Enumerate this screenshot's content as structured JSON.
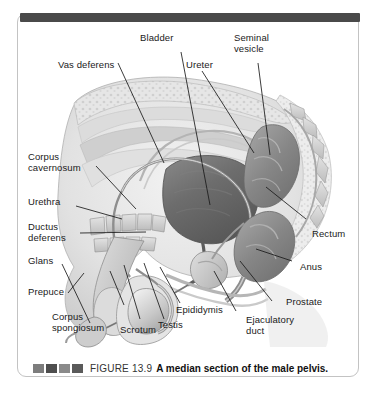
{
  "figure": {
    "number_label": "FIGURE 13.9",
    "caption": "A median section of the male pelvis.",
    "decor_blocks": [
      "block-1",
      "block-2",
      "block-3",
      "block-4"
    ],
    "frame_color": "#c3c3c3",
    "top_rule_color": "#4a4a4a"
  },
  "labels": [
    {
      "id": "bladder",
      "text": "Bladder"
    },
    {
      "id": "seminal-vesicle",
      "text": "Seminal\nvesicle"
    },
    {
      "id": "ureter",
      "text": "Ureter"
    },
    {
      "id": "vas-deferens",
      "text": "Vas deferens"
    },
    {
      "id": "corpus-cavernosum",
      "text": "Corpus\ncavernosum"
    },
    {
      "id": "urethra",
      "text": "Urethra"
    },
    {
      "id": "ductus-deferens",
      "text": "Ductus\ndeferens"
    },
    {
      "id": "glans",
      "text": "Glans"
    },
    {
      "id": "prepuce",
      "text": "Prepuce"
    },
    {
      "id": "corpus-spongiosum",
      "text": "Corpus\nspongiosum"
    },
    {
      "id": "scrotum",
      "text": "Scrotum"
    },
    {
      "id": "testis",
      "text": "Testis"
    },
    {
      "id": "epididymis",
      "text": "Epididymis"
    },
    {
      "id": "ejaculatory-duct",
      "text": "Ejaculatory\nduct"
    },
    {
      "id": "prostate",
      "text": "Prostate"
    },
    {
      "id": "anus",
      "text": "Anus"
    },
    {
      "id": "rectum",
      "text": "Rectum"
    }
  ],
  "illustration": {
    "name": "median-section-male-pelvis",
    "style": "grayscale anatomical halftone drawing",
    "palette": {
      "tissue_light": "#e9e9e9",
      "tissue_mid": "#cfcfcf",
      "tissue_dark": "#9a9a9a",
      "bladder": "#6f6f6f",
      "rectum": "#8d8d8d",
      "outline": "#6b6b6b",
      "leader_line": "#1a1a1a"
    }
  }
}
